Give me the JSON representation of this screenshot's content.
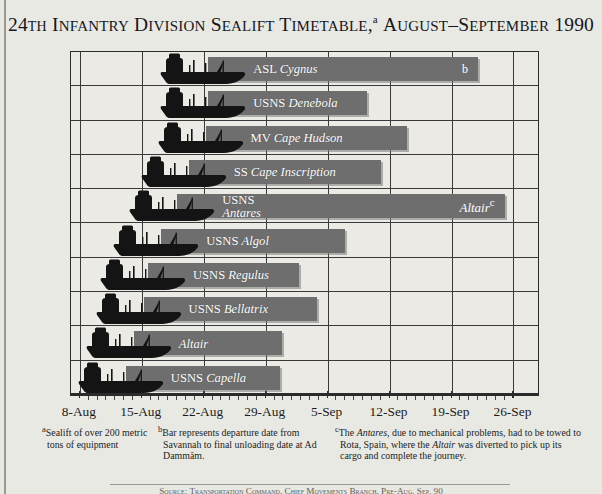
{
  "title": {
    "main_pre": "24",
    "main": "th Infantry Division Sealift Timetable,",
    "superscript": "a",
    "main_post": " August–September 1990",
    "full_text": "24TH INFANTRY DIVISION SEALIFT TIMETABLE,a AUGUST–SEPTEMBER 1990"
  },
  "chart_data": {
    "type": "bar",
    "orientation": "horizontal",
    "xlabel": "",
    "ylabel": "",
    "axis_type": "date",
    "x_tick_labels": [
      "8-Aug",
      "15-Aug",
      "22-Aug",
      "29-Aug",
      "5-Sep",
      "12-Sep",
      "19-Sep",
      "26-Sep"
    ],
    "x_tick_values": [
      8,
      15,
      22,
      29,
      36,
      43,
      50,
      57
    ],
    "xlim": [
      7,
      60
    ],
    "minor_ticks_per_interval": 7,
    "grid": "vertical-major-and-horizontal-rows",
    "bar_color": "#6e6e6e",
    "plot_bg": "#eceae5",
    "series": [
      {
        "name": "ASL Cygnus",
        "label_plain": "ASL ",
        "label_italic": "Cygnus",
        "start": 22.5,
        "end": 53.0,
        "note": "b",
        "note_on_bar": true
      },
      {
        "name": "USNS Denebola",
        "label_plain": "USNS  ",
        "label_italic": "Denebola",
        "start": 22.5,
        "end": 40.5,
        "note": "",
        "note_on_bar": false
      },
      {
        "name": "MV Cape Hudson",
        "label_plain": "MV ",
        "label_italic": "Cape Hudson",
        "start": 22.2,
        "end": 45.0,
        "note": "",
        "note_on_bar": false
      },
      {
        "name": "SS Cape Inscription",
        "label_plain": "SS ",
        "label_italic": "Cape Inscription",
        "start": 20.3,
        "end": 42.0,
        "note": "",
        "note_on_bar": false
      },
      {
        "name": "USNS Antares",
        "label_plain": "USNS",
        "label_italic": "Antares",
        "two_line": true,
        "start": 19.0,
        "end": 56.0,
        "note": "Altair",
        "note_sup": "c",
        "note_on_bar": true,
        "note_italic": true
      },
      {
        "name": "USNS Algol",
        "label_plain": "USNS ",
        "label_italic": "Algol",
        "start": 17.2,
        "end": 38.0,
        "note": "",
        "note_on_bar": false
      },
      {
        "name": "USNS Regulus",
        "label_plain": "USNS ",
        "label_italic": "Regulus",
        "start": 15.7,
        "end": 32.8,
        "note": "",
        "note_on_bar": false
      },
      {
        "name": "USNS Bellatrix",
        "label_plain": "USNS ",
        "label_italic": "Bellatrix",
        "start": 15.2,
        "end": 34.8,
        "note": "",
        "note_on_bar": false
      },
      {
        "name": "Altair",
        "label_plain": "",
        "label_italic": "Altair",
        "start": 14.1,
        "end": 30.8,
        "note": "",
        "note_on_bar": false
      },
      {
        "name": "USNS Capella",
        "label_plain": "USNS ",
        "label_italic": "Capella",
        "start": 13.2,
        "end": 30.6,
        "note": "",
        "note_on_bar": false
      }
    ]
  },
  "footnotes": [
    {
      "marker": "a",
      "text": "Sealift of over 200 metric tons of equipment"
    },
    {
      "marker": "b",
      "text": "Bar represents departure date from Savannah to final unloading date at Ad Dammām."
    },
    {
      "marker": "c",
      "text_parts": [
        {
          "t": "The ",
          "i": false
        },
        {
          "t": "Antares",
          "i": true
        },
        {
          "t": ", due to mechanical problems, had to be towed to Rota, Spain, where the ",
          "i": false
        },
        {
          "t": "Altair",
          "i": true
        },
        {
          "t": " was diverted to pick up its cargo and complete the journey.",
          "i": false
        }
      ],
      "text": "The Antares, due to mechanical problems, had to be towed to Rota, Spain, where the Altair was diverted to pick up its cargo and complete the journey."
    }
  ],
  "source_line": "Source: Transportation Command, Chief Movements Branch, Pre-Aug. Sep. 90"
}
